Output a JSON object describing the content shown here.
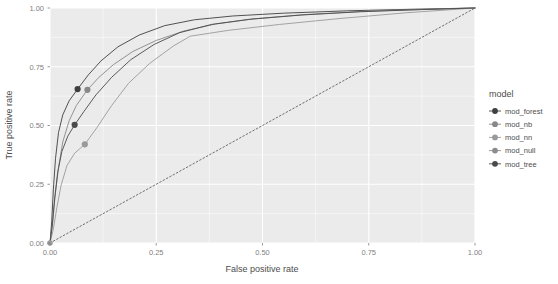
{
  "chart_data": {
    "type": "line",
    "title": "",
    "xlabel": "False positive rate",
    "ylabel": "True positive rate",
    "xlim": [
      0.0,
      1.0
    ],
    "ylim": [
      0.0,
      1.0
    ],
    "xticks": [
      "0.00",
      "0.25",
      "0.50",
      "0.75",
      "1.00"
    ],
    "xtick_values": [
      0.0,
      0.25,
      0.5,
      0.75,
      1.0
    ],
    "yticks": [
      "0.00",
      "0.25",
      "0.50",
      "0.75",
      "1.00"
    ],
    "ytick_values": [
      0.0,
      0.25,
      0.5,
      0.75,
      1.0
    ],
    "grid": true,
    "panel_background": "#ebebeb",
    "grid_color": "#ffffff",
    "legend_position": "right",
    "legend_title": "model",
    "series": [
      {
        "name": "mod_forest",
        "color": "#3f3f3f",
        "linestyle": "solid",
        "marker_point": {
          "x": 0.065,
          "y": 0.655
        },
        "points": [
          [
            0.0,
            0.0
          ],
          [
            0.004,
            0.09
          ],
          [
            0.008,
            0.23
          ],
          [
            0.013,
            0.36
          ],
          [
            0.02,
            0.47
          ],
          [
            0.03,
            0.545
          ],
          [
            0.045,
            0.605
          ],
          [
            0.065,
            0.655
          ],
          [
            0.09,
            0.715
          ],
          [
            0.12,
            0.775
          ],
          [
            0.16,
            0.835
          ],
          [
            0.21,
            0.885
          ],
          [
            0.27,
            0.925
          ],
          [
            0.34,
            0.95
          ],
          [
            0.43,
            0.966
          ],
          [
            0.55,
            0.978
          ],
          [
            0.7,
            0.988
          ],
          [
            0.86,
            0.995
          ],
          [
            1.0,
            1.0
          ]
        ]
      },
      {
        "name": "mod_nb",
        "color": "#888888",
        "linestyle": "solid",
        "marker_point": {
          "x": 0.088,
          "y": 0.652
        },
        "points": [
          [
            0.0,
            0.0
          ],
          [
            0.006,
            0.08
          ],
          [
            0.012,
            0.2
          ],
          [
            0.02,
            0.32
          ],
          [
            0.03,
            0.43
          ],
          [
            0.045,
            0.52
          ],
          [
            0.062,
            0.585
          ],
          [
            0.088,
            0.652
          ],
          [
            0.115,
            0.705
          ],
          [
            0.15,
            0.76
          ],
          [
            0.195,
            0.815
          ],
          [
            0.25,
            0.862
          ],
          [
            0.315,
            0.902
          ],
          [
            0.39,
            0.932
          ],
          [
            0.48,
            0.954
          ],
          [
            0.6,
            0.972
          ],
          [
            0.74,
            0.986
          ],
          [
            0.88,
            0.994
          ],
          [
            1.0,
            1.0
          ]
        ]
      },
      {
        "name": "mod_nn",
        "color": "#9a9a9a",
        "linestyle": "solid",
        "marker_point": {
          "x": 0.082,
          "y": 0.42
        },
        "points": [
          [
            0.0,
            0.0
          ],
          [
            0.008,
            0.06
          ],
          [
            0.016,
            0.15
          ],
          [
            0.026,
            0.245
          ],
          [
            0.04,
            0.33
          ],
          [
            0.058,
            0.382
          ],
          [
            0.082,
            0.42
          ],
          [
            0.11,
            0.49
          ],
          [
            0.145,
            0.585
          ],
          [
            0.185,
            0.68
          ],
          [
            0.235,
            0.765
          ],
          [
            0.29,
            0.838
          ],
          [
            0.33,
            0.88
          ],
          [
            0.42,
            0.905
          ],
          [
            0.54,
            0.93
          ],
          [
            0.68,
            0.955
          ],
          [
            0.84,
            0.98
          ],
          [
            1.0,
            1.0
          ]
        ]
      },
      {
        "name": "mod_null",
        "color": "#6f6f6f",
        "linestyle": "dotted",
        "marker_point": null,
        "points": [
          [
            0.0,
            0.0
          ],
          [
            1.0,
            1.0
          ]
        ]
      },
      {
        "name": "mod_tree",
        "color": "#4a4a4a",
        "linestyle": "solid",
        "marker_point": {
          "x": 0.058,
          "y": 0.503
        },
        "points": [
          [
            0.0,
            0.0
          ],
          [
            0.005,
            0.07
          ],
          [
            0.011,
            0.19
          ],
          [
            0.018,
            0.3
          ],
          [
            0.028,
            0.39
          ],
          [
            0.042,
            0.455
          ],
          [
            0.058,
            0.503
          ],
          [
            0.08,
            0.56
          ],
          [
            0.108,
            0.63
          ],
          [
            0.145,
            0.705
          ],
          [
            0.19,
            0.78
          ],
          [
            0.245,
            0.845
          ],
          [
            0.305,
            0.895
          ],
          [
            0.38,
            0.93
          ],
          [
            0.47,
            0.952
          ],
          [
            0.59,
            0.97
          ],
          [
            0.73,
            0.984
          ],
          [
            0.87,
            0.993
          ],
          [
            1.0,
            1.0
          ]
        ]
      }
    ],
    "legend_entries": [
      {
        "label": "mod_forest",
        "color": "#3f3f3f"
      },
      {
        "label": "mod_nb",
        "color": "#888888"
      },
      {
        "label": "mod_nn",
        "color": "#9a9a9a"
      },
      {
        "label": "mod_null",
        "color": "#8d8d8d"
      },
      {
        "label": "mod_tree",
        "color": "#4a4a4a"
      }
    ]
  }
}
